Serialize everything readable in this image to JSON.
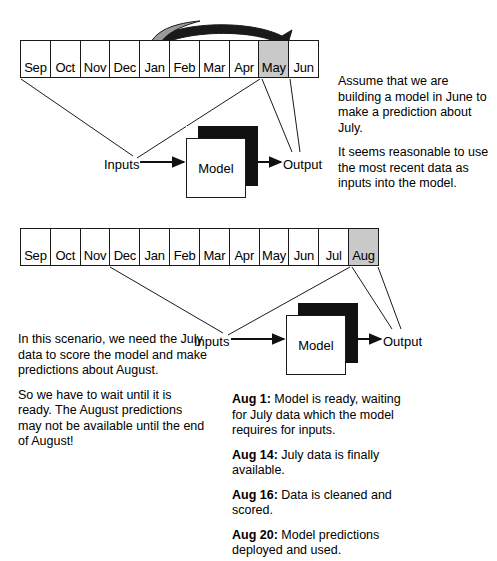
{
  "diagram": {
    "colors": {
      "highlight": "#c9c9c9",
      "cube_shadow": "#111111",
      "stroke": "#1a1a1a",
      "background": "#ffffff"
    }
  },
  "section1": {
    "timeline": {
      "months": [
        "Sep",
        "Oct",
        "Nov",
        "Dec",
        "Jan",
        "Feb",
        "Mar",
        "Apr",
        "May",
        "Jun"
      ],
      "highlighted": "May"
    },
    "curved_arrow": {
      "from": "Jan",
      "to": "May"
    },
    "cube_label": "Model",
    "inputs_label": "Inputs",
    "output_label": "Output",
    "paragraphs": [
      "Assume that we are building a model in June to make a prediction about July.",
      "It seems reasonable to use the most recent data as inputs into the model."
    ]
  },
  "section2": {
    "timeline": {
      "months": [
        "Sep",
        "Oct",
        "Nov",
        "Dec",
        "Jan",
        "Feb",
        "Mar",
        "Apr",
        "May",
        "Jun",
        "Jul",
        "Aug"
      ],
      "highlighted": "Aug"
    },
    "cube_label": "Model",
    "inputs_label": "Inputs",
    "output_label": "Output",
    "paragraphs": [
      "In this scenario, we need the July data to score the model and make predictions about August.",
      "So we have to wait until it is ready.  The August predictions may not be available until the end of August!"
    ],
    "schedule": [
      {
        "date": "Aug 1:",
        "text": " Model is ready, waiting for July data which the model requires for inputs."
      },
      {
        "date": "Aug 14:",
        "text": " July data is finally available."
      },
      {
        "date": "Aug 16:",
        "text": " Data is cleaned and scored."
      },
      {
        "date": "Aug 20:",
        "text": " Model predictions deployed and used."
      }
    ]
  }
}
